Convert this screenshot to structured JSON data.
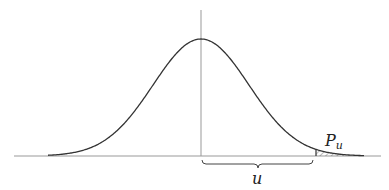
{
  "diagram": {
    "type": "normal-distribution-upper-tail",
    "curve": "bell curve (standard normal density)",
    "labels": {
      "tail_area": "P",
      "tail_area_subscript": "u",
      "distance": "u"
    },
    "colors": {
      "curve": "#333333",
      "axis": "#999999",
      "hatch": "#555555"
    }
  }
}
